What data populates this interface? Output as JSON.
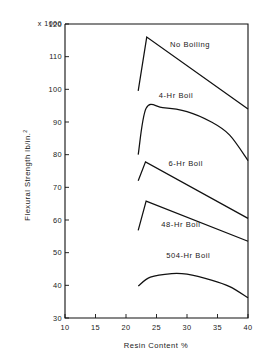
{
  "chart_data": {
    "type": "line",
    "title": "",
    "xlabel": "Resin Content %",
    "ylabel": "Flexural Strength lb/in.",
    "ylabel_superscript": "2",
    "scale_note": "x 1000",
    "xlim": [
      10,
      40
    ],
    "ylim": [
      30,
      120
    ],
    "xticks": [
      10,
      15,
      20,
      25,
      30,
      35,
      40
    ],
    "yticks": [
      30,
      40,
      50,
      60,
      70,
      80,
      90,
      100,
      110,
      120
    ],
    "xtick_labels": [
      "10",
      "15",
      "20",
      "25",
      "30",
      "35",
      "40"
    ],
    "ytick_labels": [
      "30",
      "40",
      "50",
      "60",
      "70",
      "80",
      "90",
      "100",
      "110",
      "120"
    ],
    "grid": false,
    "legend_position": "inline-annotations",
    "line_color": "#111111",
    "series": [
      {
        "name": "No Boiling",
        "label_x": 30.5,
        "label_y": 113.0,
        "smooth": false,
        "x": [
          22.0,
          23.4,
          40.0
        ],
        "values": [
          99.5,
          116.0,
          94.0
        ]
      },
      {
        "name": "4-Hr Boil",
        "label_x": 28.2,
        "label_y": 97.5,
        "smooth": true,
        "x": [
          22.0,
          23.3,
          26.0,
          30.0,
          34.0,
          37.0,
          40.0
        ],
        "values": [
          80.0,
          94.2,
          94.4,
          93.2,
          90.0,
          86.0,
          78.2
        ]
      },
      {
        "name": "6-Hr Boil",
        "label_x": 29.8,
        "label_y": 76.5,
        "smooth": false,
        "x": [
          22.0,
          23.2,
          40.0
        ],
        "values": [
          72.0,
          77.8,
          60.5
        ]
      },
      {
        "name": "48-Hr Boil",
        "label_x": 29.0,
        "label_y": 58.0,
        "smooth": false,
        "x": [
          22.0,
          23.3,
          40.0
        ],
        "values": [
          56.8,
          65.8,
          53.5
        ]
      },
      {
        "name": "504-Hr Boil",
        "label_x": 30.2,
        "label_y": 48.5,
        "smooth": true,
        "x": [
          22.0,
          24.0,
          27.5,
          30.0,
          34.0,
          37.0,
          40.0
        ],
        "values": [
          39.8,
          42.5,
          43.6,
          43.4,
          41.6,
          39.6,
          36.2
        ]
      }
    ]
  }
}
